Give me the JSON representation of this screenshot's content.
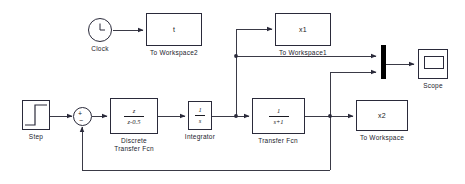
{
  "diagram": {
    "background_color": "#ffffff",
    "line_color": "#3a3a46",
    "block_border_color": "#2a2a3a",
    "mux_color": "#000000"
  },
  "blocks": {
    "clock": {
      "label": "Clock",
      "icon": "clock-face"
    },
    "to_workspace2": {
      "label": "To Workspace2",
      "variable": "t"
    },
    "to_workspace1": {
      "label": "To Workspace1",
      "variable": "x1"
    },
    "to_workspace": {
      "label": "To Workspace",
      "variable": "x2"
    },
    "step": {
      "label": "Step",
      "icon": "step-signal"
    },
    "sum": {
      "label": "",
      "plus_sign": "+",
      "minus_sign": "−"
    },
    "discrete_transfer_fcn": {
      "label": "Discrete\nTransfer Fcn",
      "numerator": "z",
      "denominator": "z-0.5"
    },
    "integrator": {
      "label": "Integrator",
      "numerator": "1",
      "denominator": "s"
    },
    "transfer_fcn": {
      "label": "Transfer Fcn",
      "numerator": "1",
      "denominator": "s+1"
    },
    "mux": {
      "label": "",
      "inputs": 2
    },
    "scope": {
      "label": "Scope",
      "icon": "scope-screen"
    }
  }
}
